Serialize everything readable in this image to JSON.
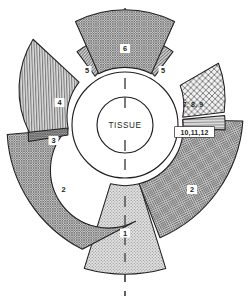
{
  "figure": {
    "type": "radial-sector-diagram",
    "center_label": "TISSUE",
    "background_color": "#ffffff",
    "line_color": "#231f20",
    "axis_color": "#58595b",
    "axis_style": "dashed vertical centerline",
    "center": {
      "x": 125,
      "y": 125
    },
    "inner_circle_radius": 28,
    "ring_outer_radius": 53
  },
  "sectors": [
    {
      "id": "sector-1",
      "label": "1",
      "position": "bottom",
      "fill": "#d9d9d9",
      "pattern": "fine-dots",
      "start_angle": 104,
      "end_angle": 76,
      "inner_radius": 60,
      "outer_radius": 150
    },
    {
      "id": "sector-2-left",
      "label": "2",
      "position": "lower-left",
      "fill": "#b3b3b3",
      "pattern": "dense-crosshatch",
      "start_angle": 175,
      "end_angle": 108,
      "inner_radius": 58,
      "outer_radius": 138
    },
    {
      "id": "sector-2-right",
      "label": "2",
      "position": "lower-right",
      "fill": "#b3b3b3",
      "pattern": "dense-crosshatch",
      "start_angle": 72,
      "end_angle": 5,
      "inner_radius": 58,
      "outer_radius": 138
    },
    {
      "id": "sector-3",
      "label": "3",
      "position": "left",
      "fill": "#a6a6a6",
      "pattern": "dense-crosshatch",
      "start_angle": 192,
      "end_angle": 176,
      "inner_radius": 58,
      "outer_radius": 96
    },
    {
      "id": "sector-4",
      "label": "4",
      "position": "upper-left",
      "fill": "#bdbdbd",
      "pattern": "vertical-lines",
      "start_angle": 140,
      "end_angle": 193,
      "inner_radius": 58,
      "outer_radius": 96
    },
    {
      "id": "sector-5-left",
      "label": "5",
      "position": "top-left",
      "fill": "#c4c4c4",
      "pattern": "diagonal-hatch",
      "start_angle": 118,
      "end_angle": 139,
      "inner_radius": 58,
      "outer_radius": 88
    },
    {
      "id": "sector-5-right",
      "label": "5",
      "position": "top-right",
      "fill": "#c4c4c4",
      "pattern": "diagonal-hatch",
      "start_angle": 41,
      "end_angle": 62,
      "inner_radius": 58,
      "outer_radius": 88
    },
    {
      "id": "sector-6",
      "label": "6",
      "position": "top",
      "fill": "#b0b0b0",
      "pattern": "dense-crosshatch",
      "start_angle": 63,
      "end_angle": 117,
      "inner_radius": 58,
      "outer_radius": 110
    },
    {
      "id": "sector-7-8-9",
      "label": "7, 8, 9",
      "position": "right-upper",
      "fill": "#e8e8e8",
      "pattern": "coarse-crosshatch",
      "start_angle": 13,
      "end_angle": 40,
      "inner_radius": 58,
      "outer_radius": 100
    },
    {
      "id": "sector-10-11-12",
      "label": "10,11,12",
      "position": "right",
      "fill": "#dcdcdc",
      "pattern": "horizontal-lines",
      "start_angle": 2,
      "end_angle": 12,
      "inner_radius": 58,
      "outer_radius": 100
    }
  ]
}
